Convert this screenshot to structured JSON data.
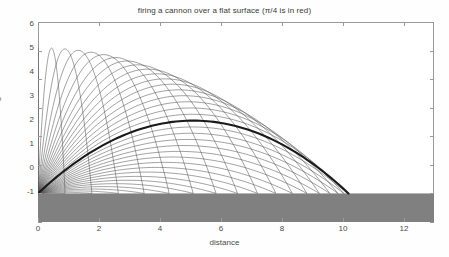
{
  "chart_data": {
    "type": "line",
    "title": "firing a cannon over a flat surface (π/4 is in red)",
    "xlabel": "distance",
    "ylabel": "height",
    "xlim": [
      0,
      13
    ],
    "ylim": [
      -1,
      6
    ],
    "xticks": [
      0,
      2,
      4,
      6,
      8,
      10,
      12
    ],
    "yticks": [
      -1,
      0,
      1,
      2,
      3,
      4,
      5,
      6
    ],
    "grid": false,
    "legend": "none",
    "physics": {
      "initial_speed": 10,
      "gravity": 9.81,
      "max_peak_height": 5.1,
      "max_range": 10.19,
      "angle_count": 36,
      "angle_min_deg": 2.5,
      "angle_max_deg": 90
    },
    "ground": {
      "label": "flat surface",
      "top_value": 0,
      "bottom_value": -1,
      "color": "#808080"
    },
    "series": [
      {
        "name": "pi/4 trajectory",
        "angle_deg": 45,
        "highlighted": true,
        "color": "#1a1a1a",
        "width": 2.1,
        "peak": {
          "x": 5.1,
          "y": 2.55
        },
        "landing_x": 10.19
      },
      {
        "name": "trajectory family",
        "highlighted": false,
        "color": "#555555",
        "width": 0.55,
        "description": "36 projectile arcs at evenly spaced launch angles from near 0 to 90 degrees"
      }
    ],
    "annotations": []
  },
  "figure": {
    "title": "firing a cannon over a flat surface (π/4 is in red)",
    "xlabel": "distance",
    "ylabel": "height",
    "xtick_labels": [
      "0",
      "2",
      "4",
      "6",
      "8",
      "10",
      "12"
    ],
    "ytick_labels": [
      "6",
      "5",
      "4",
      "3",
      "2",
      "1",
      "0",
      "-1"
    ]
  }
}
